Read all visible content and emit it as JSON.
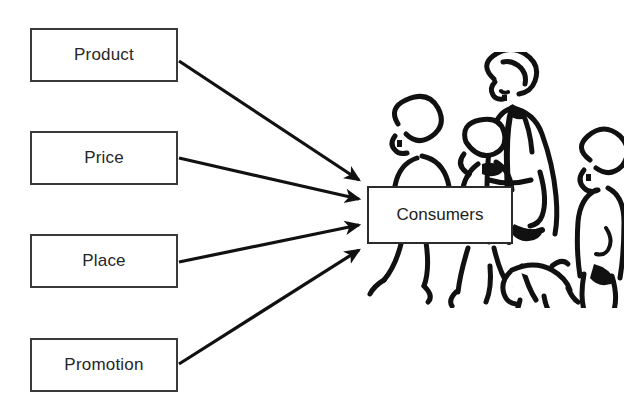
{
  "diagram": {
    "type": "flow-diagram",
    "background_color": "#ffffff",
    "line_color": "#1a1a1a",
    "box_border_color": "#3a3a3a",
    "text_color": "#262626"
  },
  "inputs": [
    {
      "id": "product",
      "label": "Product"
    },
    {
      "id": "price",
      "label": "Price"
    },
    {
      "id": "place",
      "label": "Place"
    },
    {
      "id": "promotion",
      "label": "Promotion"
    }
  ],
  "target": {
    "id": "consumers",
    "label": "Consumers"
  },
  "connections": [
    {
      "from": "product",
      "to": "consumers",
      "style": "arrow"
    },
    {
      "from": "price",
      "to": "consumers",
      "style": "arrow"
    },
    {
      "from": "place",
      "to": "consumers",
      "style": "arrow"
    },
    {
      "from": "promotion",
      "to": "consumers",
      "style": "arrow"
    }
  ],
  "illustration": {
    "name": "shoppers-line-art",
    "description": "Black and white line drawing of an adult with children and a dog walking",
    "figures": [
      "adult",
      "child-left",
      "child-center",
      "child-right",
      "dog"
    ]
  }
}
